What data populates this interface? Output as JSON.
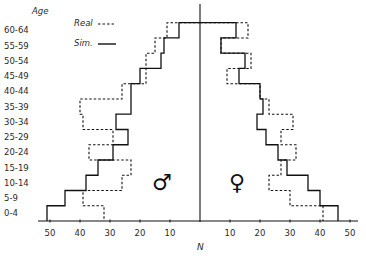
{
  "chart_data": {
    "type": "bar",
    "subtype": "population-pyramid-step",
    "title": "",
    "ylabel": "Age",
    "xlabel": "N",
    "categories": [
      "0-4",
      "5-9",
      "10-14",
      "15-19",
      "20-24",
      "25-29",
      "30-34",
      "35-39",
      "40-44",
      "45-49",
      "50-54",
      "55-59",
      "60-64"
    ],
    "x_ticks_left": [
      50,
      40,
      30,
      20,
      10
    ],
    "x_ticks_right": [
      10,
      20,
      30,
      40,
      50
    ],
    "xlim": [
      -55,
      50
    ],
    "legend": [
      {
        "name": "Real",
        "style": "dashed"
      },
      {
        "name": "Sim.",
        "style": "solid"
      }
    ],
    "legend_position": "upper-left",
    "grid": false,
    "sides": {
      "left": {
        "sex": "male",
        "symbol": "♂"
      },
      "right": {
        "sex": "female",
        "symbol": "♀"
      }
    },
    "series": [
      {
        "name": "Real",
        "side": "male",
        "values": [
          32,
          39,
          26,
          23,
          37,
          29,
          39,
          40,
          26,
          18,
          18,
          15,
          11
        ]
      },
      {
        "name": "Sim.",
        "side": "male",
        "values": [
          51,
          45,
          38,
          34,
          29,
          24,
          28,
          23,
          23,
          20,
          13,
          12,
          7
        ]
      },
      {
        "name": "Real",
        "side": "female",
        "values": [
          41,
          30,
          23,
          27,
          32,
          27,
          31,
          23,
          20,
          9,
          17,
          7,
          16
        ]
      },
      {
        "name": "Sim.",
        "side": "female",
        "values": [
          46,
          40,
          36,
          29,
          26,
          22,
          19,
          21,
          20,
          13,
          15,
          7,
          12
        ]
      }
    ]
  },
  "labels": {
    "age_title": "Age",
    "legend_real": "Real",
    "legend_sim": "Sim.",
    "n_label": "N",
    "male_symbol": "♂",
    "female_symbol": "♀"
  }
}
